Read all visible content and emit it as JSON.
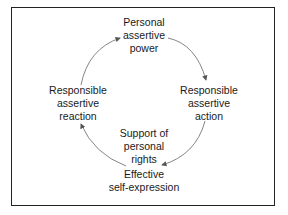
{
  "diagram": {
    "type": "cycle",
    "nodes": [
      {
        "id": "top",
        "lines": [
          "Personal",
          "assertive",
          "power"
        ]
      },
      {
        "id": "right",
        "lines": [
          "Responsible",
          "assertive",
          "action"
        ]
      },
      {
        "id": "bottom",
        "lines": [
          "Effective",
          "self-expression"
        ]
      },
      {
        "id": "left",
        "lines": [
          "Responsible",
          "assertive",
          "reaction"
        ]
      }
    ],
    "center": {
      "lines": [
        "Support of",
        "personal",
        "rights"
      ]
    },
    "edges": [
      {
        "from": "top",
        "to": "right"
      },
      {
        "from": "right",
        "to": "bottom"
      },
      {
        "from": "bottom",
        "to": "left"
      },
      {
        "from": "left",
        "to": "top"
      }
    ],
    "colors": {
      "arrow": "#666666",
      "border": "#222222",
      "text": "#1a1a1a"
    }
  }
}
